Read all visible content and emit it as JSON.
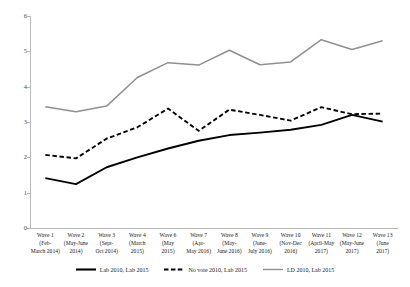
{
  "chart_data": {
    "type": "line",
    "title": "",
    "subtitle": "",
    "xlabel": "",
    "ylabel": "",
    "ylim": [
      0,
      6
    ],
    "yticks": [
      0,
      1,
      2,
      3,
      4,
      5,
      6
    ],
    "grid": false,
    "legend_position": "bottom",
    "categories": [
      "Wave 1\n(Feb-\nMarch 2014)",
      "Wave 2\n(May-June\n2014)",
      "Wave 3\n(Sept-\nOct 2014)",
      "Wave 4\n(March\n2015)",
      "Wave 6\n(May\n2015)",
      "Wave 7\n(Apr-\nMay 2016)",
      "Wave 8\n(May-\nJune 2016)",
      "Wave 9\n(June-\nJuly 2016)",
      "Wave 10\n(Nov-Dec\n2016)",
      "Wave 11\n(April-May\n2017)",
      "Wave 12\n(May-June\n2017)",
      "Wave 13\n(June\n2017)"
    ],
    "series": [
      {
        "name": "Lab 2010, Lab 2015",
        "style": "solid",
        "color": "#000000",
        "values": [
          1.41,
          1.24,
          1.72,
          2.0,
          2.25,
          2.47,
          2.63,
          2.7,
          2.78,
          2.92,
          3.2,
          3.01
        ]
      },
      {
        "name": "No vote 2010, Lab 2015",
        "style": "dashed",
        "color": "#000000",
        "values": [
          2.07,
          1.97,
          2.53,
          2.85,
          3.38,
          2.75,
          3.35,
          3.2,
          3.04,
          3.42,
          3.22,
          3.24
        ]
      },
      {
        "name": "LD 2010, Lab 2015",
        "style": "solid",
        "color": "#909090",
        "values": [
          3.43,
          3.29,
          3.45,
          4.26,
          4.68,
          4.61,
          5.03,
          4.62,
          4.7,
          5.33,
          5.05,
          5.3
        ]
      }
    ]
  },
  "axis": {
    "y_tick_labels": [
      "0",
      "1",
      "2",
      "3",
      "4",
      "5",
      "6"
    ]
  }
}
